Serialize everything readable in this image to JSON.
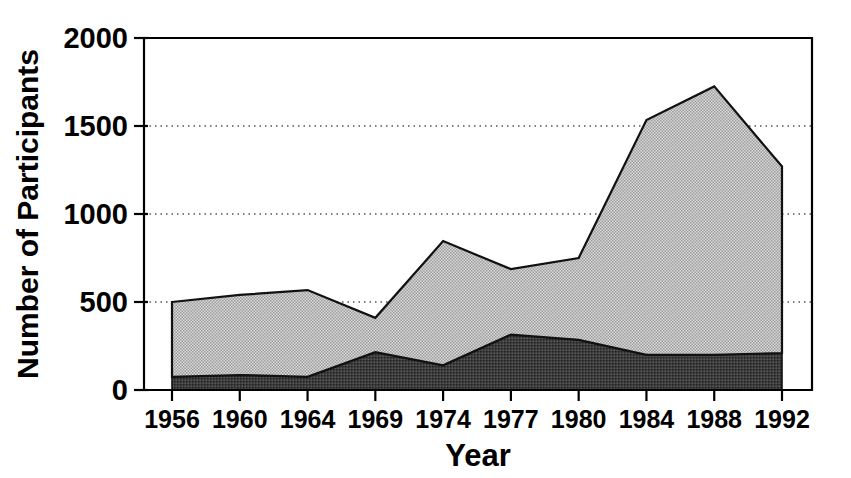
{
  "chart_data": {
    "type": "area",
    "title": "",
    "subtitle": "",
    "xlabel": "Year",
    "ylabel": "Number of Participants",
    "categories": [
      "1956",
      "1960",
      "1964",
      "1969",
      "1974",
      "1977",
      "1980",
      "1984",
      "1988",
      "1992"
    ],
    "x_tick_labels": [
      "1956",
      "1960",
      "1964",
      "1969",
      "1974",
      "1977",
      "1980",
      "1984",
      "1988",
      "1992"
    ],
    "y_tick_labels": [
      "0",
      "500",
      "1000",
      "1500",
      "2000"
    ],
    "y_ticks": [
      0,
      500,
      1000,
      1500,
      2000
    ],
    "ylim": [
      0,
      2000
    ],
    "grid": "horizontal-dotted",
    "legend": "none",
    "stacked": true,
    "series": [
      {
        "name": "lower-dark-band",
        "fill": "#3a3a3a",
        "values": [
          75,
          85,
          75,
          215,
          140,
          315,
          285,
          200,
          200,
          210
        ]
      },
      {
        "name": "upper-light-band",
        "fill": "#c8c8c8",
        "values": [
          425,
          455,
          493,
          195,
          706,
          372,
          465,
          1334,
          1525,
          1060
        ]
      }
    ],
    "totals": [
      500,
      540,
      568,
      410,
      846,
      687,
      750,
      1534,
      1725,
      1270
    ]
  },
  "axes": {
    "x_axis_label": "Year",
    "y_axis_label": "Number of Participants",
    "frame_color": "#000000",
    "grid_color": "#555555",
    "background": "#ffffff"
  },
  "style": {
    "dark_band_color": "#3a3a3a",
    "light_band_color": "#c9c9c9",
    "outline_color": "#111111"
  }
}
